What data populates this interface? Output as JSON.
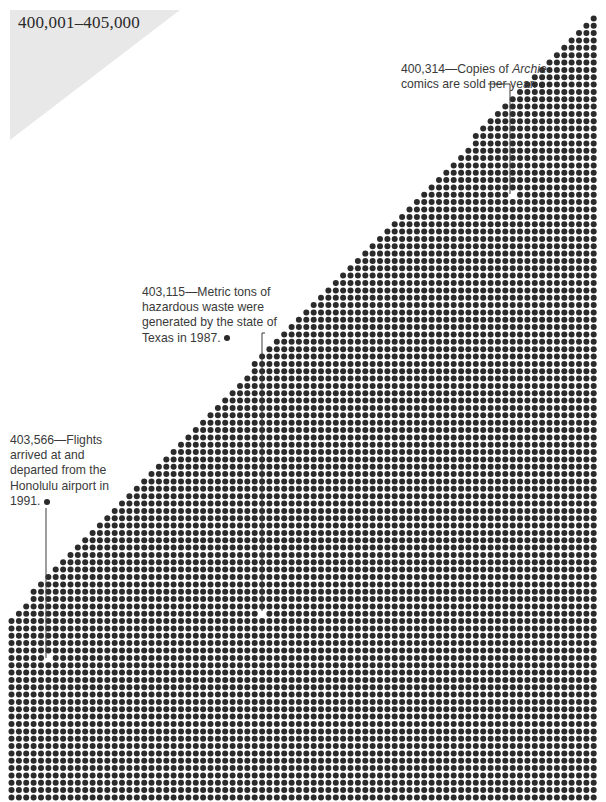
{
  "header": {
    "range_label": "400,001–405,000"
  },
  "annotations": [
    {
      "id": "archie",
      "value": "400,314",
      "dash": "—",
      "text_before_italic": "Copies of ",
      "italic": "Archie",
      "text_after_italic": " comics are sold per year.",
      "lines": [
        "400,314—Copies of Archie",
        "comics are sold per year."
      ]
    },
    {
      "id": "texas-waste",
      "value": "403,115",
      "dash": "—",
      "text": "Metric tons of hazardous waste were generated by the state of Texas in 1987.",
      "lines": [
        "403,115—Metric tons of",
        "hazardous waste were",
        "generated by the state of",
        "Texas in 1987."
      ]
    },
    {
      "id": "honolulu-flights",
      "value": "403,566",
      "dash": "—",
      "text": "Flights arrived at and departed from the Honolulu airport in 1991.",
      "lines": [
        "403,566—Flights",
        "arrived at and",
        "departed from the",
        "Honolulu airport in",
        "1991."
      ]
    }
  ],
  "colors": {
    "dot": "#2b2b2b",
    "highlight_dot": "#ffffff",
    "leader": "#3a3a3a",
    "range_bg": "#e8e8e8",
    "text": "#3a3a3a"
  },
  "chart_data": {
    "type": "dot-matrix",
    "title": "400,001–405,000",
    "range": [
      400001,
      405000
    ],
    "highlighted": [
      {
        "value": 400314,
        "label": "Copies of Archie comics are sold per year."
      },
      {
        "value": 403115,
        "label": "Metric tons of hazardous waste were generated by the state of Texas in 1987."
      },
      {
        "value": 403566,
        "label": "Flights arrived at and departed from the Honolulu airport in 1991."
      }
    ],
    "grid": {
      "x0": 11.5,
      "y0": 797.5,
      "pitch_x": 7.37,
      "pitch_y": 7.35,
      "cols": 80,
      "rows": 108,
      "edge": {
        "top_right_x": 598,
        "top_right_y": 12,
        "bottom_left_x": 8,
        "bottom_left_y": 620
      },
      "dot_radius": 3.0
    }
  }
}
